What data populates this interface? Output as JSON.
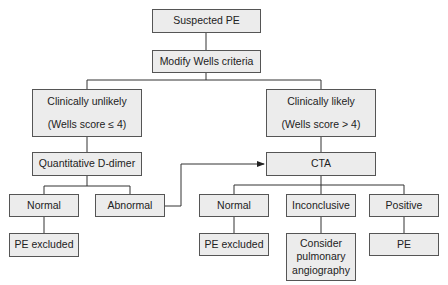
{
  "diagram": {
    "type": "flowchart",
    "topic": "Diagnostic algorithm for suspected pulmonary embolism",
    "colors": {
      "box_fill": "#ececec",
      "box_border": "#555555",
      "line": "#333333",
      "text": "#222222"
    },
    "nodes": {
      "suspected_pe": {
        "label": "Suspected PE"
      },
      "modify_wells": {
        "label": "Modify Wells criteria"
      },
      "clin_unlikely": {
        "label": "Clinically unlikely",
        "sublabel": "(Wells score ≤ 4)"
      },
      "clin_likely": {
        "label": "Clinically likely",
        "sublabel": "(Wells score > 4)"
      },
      "d_dimer": {
        "label": "Quantitative D-dimer"
      },
      "dd_normal": {
        "label": "Normal"
      },
      "dd_abnormal": {
        "label": "Abnormal"
      },
      "dd_pe_excluded": {
        "label": "PE excluded"
      },
      "cta": {
        "label": "CTA"
      },
      "cta_normal": {
        "label": "Normal"
      },
      "cta_inconclusive": {
        "label": "Inconclusive"
      },
      "cta_positive": {
        "label": "Positive"
      },
      "cta_pe_excluded": {
        "label": "PE excluded"
      },
      "consider_angio": {
        "label": "Consider pulmonary angiography"
      },
      "pe": {
        "label": "PE"
      }
    },
    "edges": [
      [
        "suspected_pe",
        "modify_wells"
      ],
      [
        "modify_wells",
        "clin_unlikely"
      ],
      [
        "modify_wells",
        "clin_likely"
      ],
      [
        "clin_unlikely",
        "d_dimer"
      ],
      [
        "d_dimer",
        "dd_normal"
      ],
      [
        "d_dimer",
        "dd_abnormal"
      ],
      [
        "dd_normal",
        "dd_pe_excluded"
      ],
      [
        "dd_abnormal",
        "cta",
        "arrow"
      ],
      [
        "clin_likely",
        "cta"
      ],
      [
        "cta",
        "cta_normal"
      ],
      [
        "cta",
        "cta_inconclusive"
      ],
      [
        "cta",
        "cta_positive"
      ],
      [
        "cta_normal",
        "cta_pe_excluded"
      ],
      [
        "cta_inconclusive",
        "consider_angio"
      ],
      [
        "cta_positive",
        "pe"
      ]
    ]
  }
}
